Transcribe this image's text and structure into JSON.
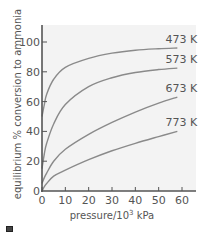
{
  "chart_data": {
    "type": "line",
    "title": "",
    "xlabel": "pressure/10³ kPa",
    "xlabel_base": "pressure/10",
    "xlabel_sup": "3",
    "xlabel_unit": " kPa",
    "ylabel": "equilibrium % conversion to ammonia",
    "xlim": [
      0,
      66
    ],
    "ylim": [
      0,
      110
    ],
    "x_ticks": [
      0,
      10,
      20,
      30,
      40,
      50,
      60
    ],
    "y_ticks": [
      0,
      20,
      40,
      60,
      80,
      100
    ],
    "grid": false,
    "legend": "inline labels at right end of each curve",
    "x": [
      0,
      1,
      2,
      5,
      10,
      20,
      30,
      40,
      50,
      58
    ],
    "series": [
      {
        "name": "473 K",
        "values": [
          50,
          58,
          65,
          75,
          83,
          89,
          92.5,
          94.5,
          95.5,
          96
        ]
      },
      {
        "name": "573 K",
        "values": [
          15,
          25,
          32,
          45,
          58,
          70,
          76,
          79.5,
          81.5,
          82.5
        ]
      },
      {
        "name": "673 K",
        "values": [
          5,
          9,
          12,
          20,
          28,
          38,
          46,
          53,
          59,
          63
        ]
      },
      {
        "name": "773 K",
        "values": [
          0,
          3,
          5,
          10,
          14,
          21,
          27,
          32,
          36.5,
          40
        ]
      }
    ],
    "colors": {
      "plot_background": "#f3f3f3",
      "axis": "#555555",
      "curve": "#8a8a8a",
      "text": "#555555"
    }
  },
  "footer_icon": "square-icon"
}
